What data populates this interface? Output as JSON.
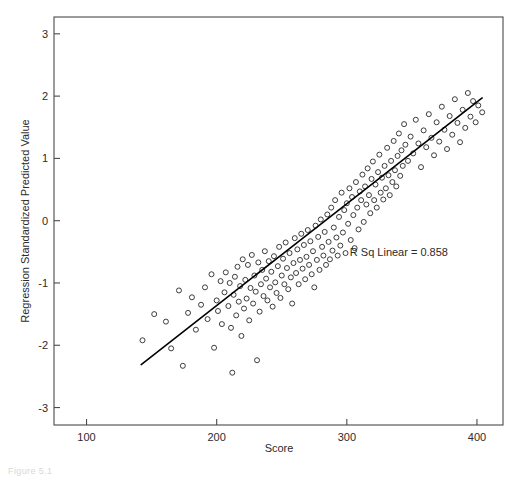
{
  "figure": {
    "caption": "Figure 5.1"
  },
  "chart_data": {
    "type": "scatter",
    "title": "",
    "xlabel": "Score",
    "ylabel": "Regression Standardized Predicted Value",
    "xlim": [
      75,
      420
    ],
    "ylim": [
      -3.28,
      3.27
    ],
    "xticks": [
      100,
      200,
      300,
      400
    ],
    "xtick_labels": [
      "100",
      "200",
      "300",
      "400"
    ],
    "yticks": [
      -3,
      -2,
      -1,
      0,
      1,
      2,
      3
    ],
    "ytick_labels": [
      "-3",
      "-2",
      "-1",
      "0",
      "1",
      "2",
      "3"
    ],
    "grid": false,
    "legend": null,
    "marker": "open-circle",
    "marker_size": 5,
    "marker_color": "#333333",
    "annotations": [
      {
        "text": "R Sq Linear = 0.858",
        "x": 340,
        "y": -0.56
      }
    ],
    "fit_line": {
      "type": "linear",
      "color": "#000000",
      "width": 1.6,
      "x_start": 142,
      "y_start": -2.31,
      "x_end": 404,
      "y_end": 1.97
    },
    "r_squared": 0.858,
    "n_points": 178,
    "points": [
      [
        143,
        -1.92
      ],
      [
        152,
        -1.5
      ],
      [
        161,
        -1.62
      ],
      [
        165,
        -2.05
      ],
      [
        171,
        -1.12
      ],
      [
        174,
        -2.33
      ],
      [
        178,
        -1.48
      ],
      [
        181,
        -1.23
      ],
      [
        184,
        -1.75
      ],
      [
        188,
        -1.35
      ],
      [
        191,
        -1.07
      ],
      [
        193,
        -1.58
      ],
      [
        196,
        -0.86
      ],
      [
        198,
        -2.04
      ],
      [
        200,
        -1.28
      ],
      [
        201,
        -1.45
      ],
      [
        203,
        -0.97
      ],
      [
        204,
        -1.66
      ],
      [
        206,
        -1.15
      ],
      [
        207,
        -0.83
      ],
      [
        209,
        -1.37
      ],
      [
        210,
        -1.0
      ],
      [
        211,
        -1.72
      ],
      [
        212,
        -2.44
      ],
      [
        213,
        -1.19
      ],
      [
        214,
        -0.9
      ],
      [
        215,
        -1.52
      ],
      [
        216,
        -0.74
      ],
      [
        217,
        -1.3
      ],
      [
        218,
        -1.05
      ],
      [
        219,
        -1.85
      ],
      [
        220,
        -0.62
      ],
      [
        221,
        -1.41
      ],
      [
        222,
        -0.95
      ],
      [
        223,
        -1.25
      ],
      [
        224,
        -0.71
      ],
      [
        225,
        -1.6
      ],
      [
        226,
        -1.08
      ],
      [
        227,
        -0.55
      ],
      [
        228,
        -1.33
      ],
      [
        229,
        -0.88
      ],
      [
        230,
        -1.14
      ],
      [
        231,
        -2.24
      ],
      [
        232,
        -0.67
      ],
      [
        233,
        -1.46
      ],
      [
        234,
        -1.02
      ],
      [
        235,
        -0.79
      ],
      [
        236,
        -1.21
      ],
      [
        237,
        -0.49
      ],
      [
        238,
        -0.93
      ],
      [
        239,
        -1.28
      ],
      [
        240,
        -0.65
      ],
      [
        241,
        -1.07
      ],
      [
        242,
        -0.82
      ],
      [
        243,
        -1.38
      ],
      [
        244,
        -0.57
      ],
      [
        245,
        -0.99
      ],
      [
        246,
        -1.16
      ],
      [
        247,
        -0.73
      ],
      [
        248,
        -0.42
      ],
      [
        249,
        -1.24
      ],
      [
        250,
        -0.88
      ],
      [
        251,
        -0.61
      ],
      [
        252,
        -1.02
      ],
      [
        253,
        -0.35
      ],
      [
        254,
        -0.76
      ],
      [
        255,
        -1.1
      ],
      [
        256,
        -0.52
      ],
      [
        257,
        -0.91
      ],
      [
        258,
        -1.33
      ],
      [
        259,
        -0.68
      ],
      [
        260,
        -0.28
      ],
      [
        261,
        -0.84
      ],
      [
        262,
        -0.46
      ],
      [
        263,
        -1.02
      ],
      [
        264,
        -0.63
      ],
      [
        265,
        -0.21
      ],
      [
        266,
        -0.77
      ],
      [
        267,
        -0.39
      ],
      [
        268,
        -0.94
      ],
      [
        269,
        -0.58
      ],
      [
        270,
        -0.15
      ],
      [
        271,
        -0.71
      ],
      [
        272,
        -0.33
      ],
      [
        273,
        -0.86
      ],
      [
        274,
        -0.49
      ],
      [
        275,
        -1.07
      ],
      [
        276,
        -0.08
      ],
      [
        277,
        -0.63
      ],
      [
        278,
        -0.26
      ],
      [
        279,
        -0.79
      ],
      [
        280,
        0.02
      ],
      [
        281,
        -0.42
      ],
      [
        282,
        -0.56
      ],
      [
        283,
        -0.18
      ],
      [
        284,
        -0.71
      ],
      [
        285,
        0.1
      ],
      [
        286,
        -0.34
      ],
      [
        287,
        -0.62
      ],
      [
        288,
        0.21
      ],
      [
        289,
        -0.48
      ],
      [
        290,
        -0.11
      ],
      [
        291,
        0.33
      ],
      [
        292,
        -0.27
      ],
      [
        293,
        -0.56
      ],
      [
        294,
        0.06
      ],
      [
        295,
        -0.4
      ],
      [
        296,
        0.45
      ],
      [
        297,
        -0.19
      ],
      [
        298,
        0.17
      ],
      [
        299,
        -0.52
      ],
      [
        300,
        0.28
      ],
      [
        301,
        -0.05
      ],
      [
        302,
        0.52
      ],
      [
        303,
        -0.31
      ],
      [
        304,
        0.38
      ],
      [
        305,
        0.09
      ],
      [
        306,
        -0.44
      ],
      [
        307,
        0.62
      ],
      [
        308,
        0.21
      ],
      [
        309,
        -0.14
      ],
      [
        310,
        0.47
      ],
      [
        311,
        0.33
      ],
      [
        312,
        0.74
      ],
      [
        313,
        -0.02
      ],
      [
        314,
        0.55
      ],
      [
        315,
        0.26
      ],
      [
        316,
        0.84
      ],
      [
        317,
        0.41
      ],
      [
        318,
        0.12
      ],
      [
        319,
        0.67
      ],
      [
        320,
        0.95
      ],
      [
        321,
        0.33
      ],
      [
        322,
        0.58
      ],
      [
        323,
        0.21
      ],
      [
        324,
        0.78
      ],
      [
        325,
        1.06
      ],
      [
        326,
        0.45
      ],
      [
        327,
        0.69
      ],
      [
        328,
        0.34
      ],
      [
        329,
        0.88
      ],
      [
        330,
        0.52
      ],
      [
        331,
        1.17
      ],
      [
        332,
        0.73
      ],
      [
        333,
        0.41
      ],
      [
        334,
        0.96
      ],
      [
        335,
        0.62
      ],
      [
        336,
        1.28
      ],
      [
        337,
        0.81
      ],
      [
        338,
        0.55
      ],
      [
        339,
        1.04
      ],
      [
        340,
        1.4
      ],
      [
        341,
        0.72
      ],
      [
        342,
        1.13
      ],
      [
        343,
        0.88
      ],
      [
        344,
        1.55
      ],
      [
        345,
        1.22
      ],
      [
        347,
        0.96
      ],
      [
        349,
        1.35
      ],
      [
        351,
        1.08
      ],
      [
        353,
        1.62
      ],
      [
        355,
        1.24
      ],
      [
        357,
        0.86
      ],
      [
        359,
        1.45
      ],
      [
        361,
        1.18
      ],
      [
        363,
        1.71
      ],
      [
        365,
        1.33
      ],
      [
        367,
        1.05
      ],
      [
        369,
        1.58
      ],
      [
        371,
        1.27
      ],
      [
        373,
        1.83
      ],
      [
        375,
        1.46
      ],
      [
        377,
        1.15
      ],
      [
        379,
        1.68
      ],
      [
        381,
        1.38
      ],
      [
        383,
        1.95
      ],
      [
        385,
        1.57
      ],
      [
        387,
        1.26
      ],
      [
        389,
        1.78
      ],
      [
        391,
        1.49
      ],
      [
        393,
        2.05
      ],
      [
        395,
        1.67
      ],
      [
        397,
        1.92
      ],
      [
        399,
        1.58
      ],
      [
        401,
        1.85
      ],
      [
        404,
        1.74
      ]
    ]
  }
}
